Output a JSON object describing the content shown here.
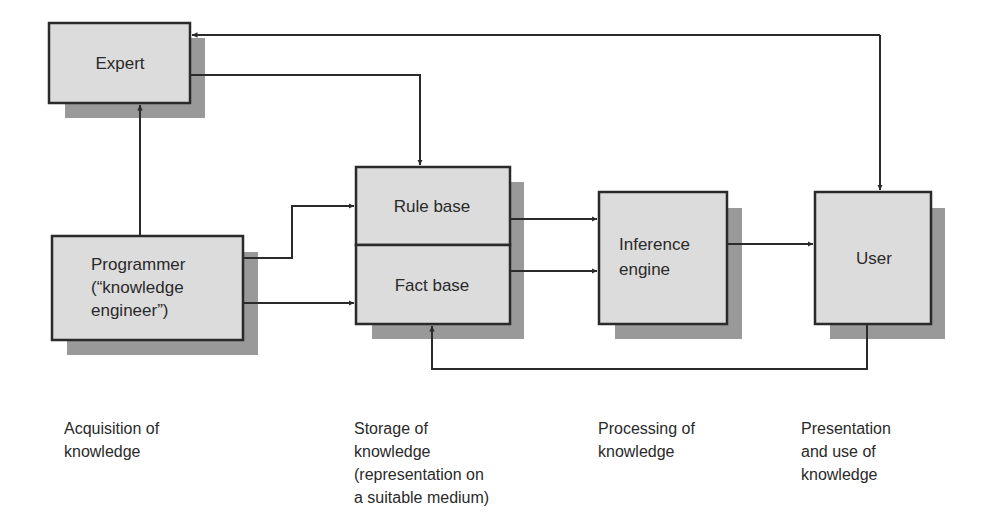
{
  "diagram": {
    "colors": {
      "box_fill": "#dcdcdc",
      "box_border": "#2a2a2a",
      "shadow": "#999999",
      "line": "#2a2a2a",
      "background": "#ffffff"
    },
    "nodes": {
      "expert": {
        "label": "Expert"
      },
      "programmer": {
        "lines": [
          "Programmer",
          "(“knowledge",
          "engineer”)"
        ]
      },
      "rule_base": {
        "label": "Rule base"
      },
      "fact_base": {
        "label": "Fact base"
      },
      "inference_engine": {
        "lines": [
          "Inference",
          "engine"
        ]
      },
      "user": {
        "label": "User"
      }
    },
    "edges": [
      {
        "from": "programmer",
        "to": "expert"
      },
      {
        "from": "expert",
        "to": "rule_base"
      },
      {
        "from": "user",
        "to": "expert"
      },
      {
        "from": "expert",
        "to": "user"
      },
      {
        "from": "programmer",
        "to": "rule_base"
      },
      {
        "from": "programmer",
        "to": "fact_base"
      },
      {
        "from": "rule_base",
        "to": "inference_engine"
      },
      {
        "from": "fact_base",
        "to": "inference_engine"
      },
      {
        "from": "inference_engine",
        "to": "user"
      },
      {
        "from": "user",
        "to": "fact_base"
      }
    ]
  },
  "captions": {
    "acquisition": "Acquisition of\nknowledge",
    "storage": "Storage of\nknowledge\n(representation on\na suitable medium)",
    "processing": "Processing of\nknowledge",
    "presentation": "Presentation\nand use of\nknowledge"
  }
}
